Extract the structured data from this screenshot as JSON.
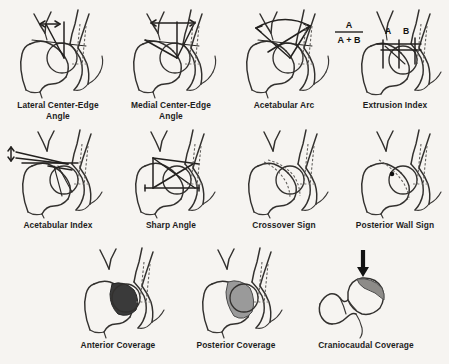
{
  "figure": {
    "background_color": "#f6f4f1",
    "ink_color": "#32302e",
    "rows": 3,
    "columns": [
      4,
      4,
      3
    ],
    "total_panels": 11
  },
  "panels": [
    {
      "id": "lateral-center-edge-angle",
      "caption": "Lateral Center-Edge\nAngle",
      "row": 1,
      "column": 1,
      "overlay_type": "angle-with-double-arrow",
      "annotations": []
    },
    {
      "id": "medial-center-edge-angle",
      "caption": "Medial Center-Edge\nAngle",
      "row": 1,
      "column": 2,
      "overlay_type": "angle-with-double-arrow",
      "annotations": []
    },
    {
      "id": "acetabular-arc",
      "caption": "Acetabular Arc",
      "row": 1,
      "column": 3,
      "overlay_type": "curved-double-arrow",
      "annotations": []
    },
    {
      "id": "extrusion-index",
      "caption": "Extrusion Index",
      "row": 1,
      "column": 4,
      "overlay_type": "formula-with-segments",
      "annotations": [
        "A",
        "B"
      ],
      "formula_numerator": "A",
      "formula_denominator": "A + B"
    },
    {
      "id": "acetabular-index",
      "caption": "Acetabular Index",
      "row": 2,
      "column": 1,
      "overlay_type": "horizontal-lines-with-vertical-arrow",
      "annotations": []
    },
    {
      "id": "sharp-angle",
      "caption": "Sharp Angle",
      "row": 2,
      "column": 2,
      "overlay_type": "triangle-baseline-angle",
      "annotations": []
    },
    {
      "id": "crossover-sign",
      "caption": "Crossover Sign",
      "row": 2,
      "column": 3,
      "overlay_type": "crossing-dashed-rim-lines",
      "annotations": []
    },
    {
      "id": "posterior-wall-sign",
      "caption": "Posterior Wall Sign",
      "row": 2,
      "column": 4,
      "overlay_type": "center-dot-with-rim-line",
      "annotations": [
        "center-dot"
      ]
    },
    {
      "id": "anterior-coverage",
      "caption": "Anterior Coverage",
      "row": 3,
      "column": 1,
      "overlay_type": "shaded-coverage",
      "shading_color": "#3a3a3a",
      "annotations": []
    },
    {
      "id": "posterior-coverage",
      "caption": "Posterior Coverage",
      "row": 3,
      "column": 2,
      "overlay_type": "shaded-coverage",
      "shading_color": "#9a9a9a",
      "annotations": []
    },
    {
      "id": "craniocaudal-coverage",
      "caption": "Craniocaudal Coverage",
      "row": 3,
      "column": 3,
      "overlay_type": "femoral-head-with-down-arrow",
      "shading_color": "#8d8b88",
      "annotations": [
        "down-arrow"
      ]
    }
  ]
}
